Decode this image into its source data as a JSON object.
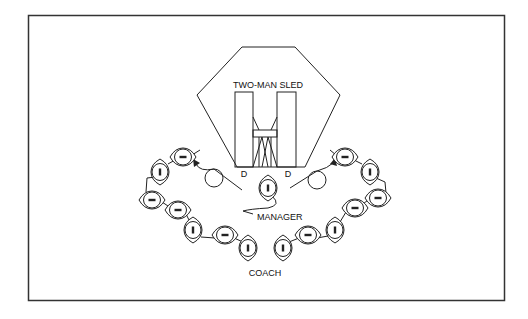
{
  "diagram": {
    "type": "drill-layout",
    "labels": {
      "sled": "TWO-MAN SLED",
      "defender_left": "D",
      "defender_right": "D",
      "manager": "MANAGER",
      "coach": "COACH"
    },
    "colors": {
      "ink": "#222222",
      "background": "#ffffff",
      "frame": "#333333"
    },
    "entities": {
      "defenders": [
        {
          "id": "defender-left",
          "label": "D"
        },
        {
          "id": "defender-right",
          "label": "D"
        }
      ],
      "blocking_circles": [
        {
          "id": "circle-left"
        },
        {
          "id": "circle-right"
        }
      ],
      "left_line_footballs": [
        {
          "orientation": "horizontal"
        },
        {
          "orientation": "vertical"
        },
        {
          "orientation": "horizontal"
        },
        {
          "orientation": "horizontal"
        },
        {
          "orientation": "vertical"
        },
        {
          "orientation": "horizontal"
        },
        {
          "orientation": "vertical"
        }
      ],
      "right_line_footballs": [
        {
          "orientation": "horizontal"
        },
        {
          "orientation": "vertical"
        },
        {
          "orientation": "horizontal"
        },
        {
          "orientation": "horizontal"
        },
        {
          "orientation": "vertical"
        },
        {
          "orientation": "horizontal"
        },
        {
          "orientation": "vertical"
        }
      ],
      "manager_football": {
        "orientation": "vertical"
      }
    }
  }
}
